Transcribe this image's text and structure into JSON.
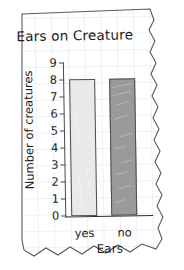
{
  "chart_data": {
    "type": "bar",
    "title": "Ears on Creature",
    "xlabel": "Ears",
    "ylabel": "Number of creatures",
    "categories": [
      "yes",
      "no"
    ],
    "values": [
      8,
      8
    ],
    "ylim": [
      0,
      9
    ],
    "yticks": [
      "9",
      "8",
      "7",
      "6",
      "5",
      "4",
      "3",
      "2",
      "1",
      "0"
    ],
    "grid": true,
    "legend": "none",
    "series": [
      {
        "name": "Number of creatures",
        "values": [
          8,
          8
        ]
      }
    ],
    "bar_colors": [
      "#e9e9e9",
      "#9a9a9a"
    ],
    "bar_edge_color": "#4d4d4d",
    "axis_color": "#2a2a2a",
    "grid_color": "#c9d3dd",
    "paper_color": "#ffffff",
    "paper_edge_color": "#555555",
    "text_color": "#1b1b1b"
  },
  "media": {
    "sheet_name": "graph-paper-sheet",
    "torn_edges": "right-wavy-bottom-zigzag"
  }
}
